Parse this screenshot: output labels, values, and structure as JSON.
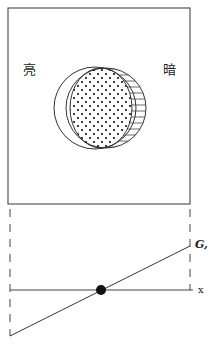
{
  "figure": {
    "labels": {
      "bright": "亮",
      "dark": "暗",
      "g_axis": "G,",
      "x_axis": "x"
    },
    "colors": {
      "stroke": "#333333",
      "background": "#ffffff",
      "dot": "#111111"
    },
    "box": {
      "x": 8,
      "y": 8,
      "width": 182,
      "height": 196
    },
    "outer_circle": {
      "cx": 95,
      "cy": 108,
      "r": 41
    },
    "dotted_ellipse": {
      "cx": 101,
      "cy": 108,
      "rx": 31,
      "ry": 40
    },
    "hatched_circle": {
      "cx": 106,
      "cy": 108,
      "r": 40
    },
    "baseline_y": 290,
    "line": {
      "x1": 10,
      "y1": 336,
      "x2": 190,
      "y2": 246
    },
    "intersection_point": {
      "cx": 101,
      "cy": 290,
      "r": 5
    }
  }
}
